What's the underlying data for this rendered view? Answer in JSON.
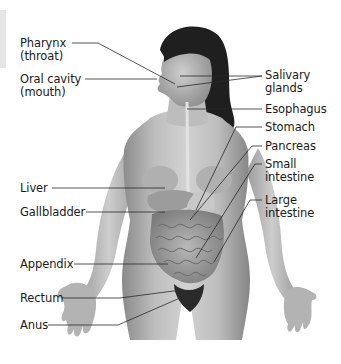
{
  "diagram": {
    "labels_left": [
      {
        "id": "pharynx",
        "line1": "Pharynx",
        "line2": "(throat)"
      },
      {
        "id": "oral-cavity",
        "line1": "Oral cavity",
        "line2": "(mouth)"
      },
      {
        "id": "liver",
        "line1": "Liver",
        "line2": ""
      },
      {
        "id": "gallbladder",
        "line1": "Gallbladder",
        "line2": ""
      },
      {
        "id": "appendix",
        "line1": "Appendix",
        "line2": ""
      },
      {
        "id": "rectum",
        "line1": "Rectum",
        "line2": ""
      },
      {
        "id": "anus",
        "line1": "Anus",
        "line2": ""
      }
    ],
    "labels_right": [
      {
        "id": "salivary-glands",
        "line1": "Salivary",
        "line2": "glands"
      },
      {
        "id": "esophagus",
        "line1": "Esophagus",
        "line2": ""
      },
      {
        "id": "stomach",
        "line1": "Stomach",
        "line2": ""
      },
      {
        "id": "pancreas",
        "line1": "Pancreas",
        "line2": ""
      },
      {
        "id": "small-intestine",
        "line1": "Small",
        "line2": "intestine"
      },
      {
        "id": "large-intestine",
        "line1": "Large",
        "line2": "intestine"
      }
    ],
    "colors": {
      "background": "#ffffff",
      "text": "#1a1a1a",
      "leader_line": "#2a2a2a",
      "hair": "#1e1e1e",
      "skin_light": "#cfcfcf",
      "skin_mid": "#a9a9a9",
      "skin_dark": "#7d7d7d"
    }
  }
}
